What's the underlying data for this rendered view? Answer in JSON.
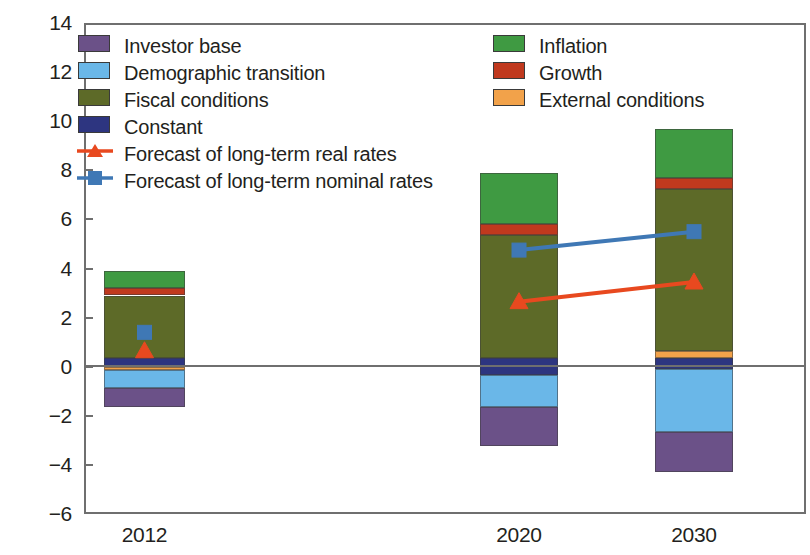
{
  "chart_data": {
    "type": "bar",
    "subtype": "stacked-bar-with-lines",
    "title": "",
    "subtitle": "",
    "xlabel": "",
    "ylabel": "",
    "categories": [
      "2012",
      "2020",
      "2030"
    ],
    "ylim": [
      -6,
      14
    ],
    "yticks": [
      -6,
      -4,
      -2,
      0,
      2,
      4,
      6,
      8,
      10,
      12,
      14
    ],
    "ytick_labels": [
      "−6",
      "−4",
      "−2",
      "0",
      "2",
      "4",
      "6",
      "8",
      "10",
      "12",
      "14"
    ],
    "grid": false,
    "legend_position": "inside-top",
    "series": [
      {
        "name": "Investor base",
        "color": "#6b5188",
        "values": [
          -0.8,
          -1.6,
          -1.65
        ]
      },
      {
        "name": "Demographic transition",
        "color": "#6ab7e8",
        "values": [
          -0.7,
          -1.3,
          -2.55
        ]
      },
      {
        "name": "Fiscal conditions",
        "color": "#5d6a28",
        "values": [
          2.55,
          5.0,
          6.6
        ]
      },
      {
        "name": "Constant",
        "color": "#2d3580",
        "values": [
          0.35,
          0.7,
          0.45
        ]
      },
      {
        "name": "Inflation",
        "color": "#3f9a42",
        "values": [
          0.7,
          2.1,
          2.0
        ]
      },
      {
        "name": "Growth",
        "color": "#c0391e",
        "values": [
          0.3,
          0.45,
          0.45
        ]
      },
      {
        "name": "External conditions",
        "color": "#f2a24a",
        "values": [
          0.15,
          0.0,
          0.3
        ]
      }
    ],
    "stack_segments": {
      "2012": [
        {
          "name": "Investor base",
          "from": -1.65,
          "to": -0.85
        },
        {
          "name": "Demographic transition",
          "from": -0.85,
          "to": -0.15
        },
        {
          "name": "External conditions",
          "from": -0.15,
          "to": 0.0
        },
        {
          "name": "Constant",
          "from": 0.0,
          "to": 0.35
        },
        {
          "name": "Fiscal conditions",
          "from": 0.35,
          "to": 2.9
        },
        {
          "name": "Growth",
          "from": 2.9,
          "to": 3.2
        },
        {
          "name": "Inflation",
          "from": 3.2,
          "to": 3.9
        }
      ],
      "2020": [
        {
          "name": "Investor base",
          "from": -3.25,
          "to": -1.65
        },
        {
          "name": "Demographic transition",
          "from": -1.65,
          "to": -0.35
        },
        {
          "name": "Constant",
          "from": -0.35,
          "to": 0.35
        },
        {
          "name": "Fiscal conditions",
          "from": 0.35,
          "to": 5.35
        },
        {
          "name": "Growth",
          "from": 5.35,
          "to": 5.8
        },
        {
          "name": "Inflation",
          "from": 5.8,
          "to": 7.9
        }
      ],
      "2030": [
        {
          "name": "Investor base",
          "from": -4.3,
          "to": -2.65
        },
        {
          "name": "Demographic transition",
          "from": -2.65,
          "to": -0.1
        },
        {
          "name": "Constant",
          "from": -0.1,
          "to": 0.35
        },
        {
          "name": "External conditions",
          "from": 0.35,
          "to": 0.65
        },
        {
          "name": "Fiscal conditions",
          "from": 0.65,
          "to": 7.25
        },
        {
          "name": "Growth",
          "from": 7.25,
          "to": 7.7
        },
        {
          "name": "Inflation",
          "from": 7.7,
          "to": 9.7
        }
      ]
    },
    "bar_totals_top": [
      3.9,
      7.9,
      9.7
    ],
    "bar_totals_bottom": [
      -1.65,
      -3.25,
      -4.3
    ],
    "lines": [
      {
        "name": "Forecast of long-term real rates",
        "color": "#e8491f",
        "marker": "triangle",
        "x": [
          "2012",
          "2020",
          "2030"
        ],
        "values": [
          0.65,
          2.65,
          3.45
        ],
        "segments_drawn": [
          [
            "2020",
            "2030"
          ]
        ]
      },
      {
        "name": "Forecast of long-term nominal rates",
        "color": "#3f78b5",
        "marker": "square",
        "x": [
          "2012",
          "2020",
          "2030"
        ],
        "values": [
          1.4,
          4.75,
          5.5
        ],
        "segments_drawn": [
          [
            "2020",
            "2030"
          ]
        ]
      }
    ]
  },
  "legend": {
    "left_column": [
      {
        "label": "Investor base",
        "color": "#6b5188",
        "marker": "swatch"
      },
      {
        "label": "Demographic transition",
        "color": "#6ab7e8",
        "marker": "swatch"
      },
      {
        "label": "Fiscal conditions",
        "color": "#5d6a28",
        "marker": "swatch"
      },
      {
        "label": "Constant",
        "color": "#2d3580",
        "marker": "swatch"
      },
      {
        "label": "Forecast of long-term real rates",
        "color": "#e8491f",
        "marker": "line-triangle"
      },
      {
        "label": "Forecast of long-term nominal rates",
        "color": "#3f78b5",
        "marker": "line-square"
      }
    ],
    "right_column": [
      {
        "label": "Inflation",
        "color": "#3f9a42",
        "marker": "swatch"
      },
      {
        "label": "Growth",
        "color": "#c0391e",
        "marker": "swatch"
      },
      {
        "label": "External conditions",
        "color": "#f2a24a",
        "marker": "swatch"
      }
    ]
  },
  "axis": {
    "y_labels": [
      "14",
      "12",
      "10",
      "8",
      "6",
      "4",
      "2",
      "0",
      "−2",
      "−4",
      "−6"
    ],
    "x_labels": [
      "2012",
      "2020",
      "2030"
    ]
  },
  "colors": {
    "investor_base": "#6b5188",
    "demographic_transition": "#6ab7e8",
    "fiscal_conditions": "#5d6a28",
    "constant": "#2d3580",
    "inflation": "#3f9a42",
    "growth": "#c0391e",
    "external_conditions": "#f2a24a",
    "real_rates_line": "#e8491f",
    "nominal_rates_line": "#3f78b5",
    "frame": "#6f6f6f",
    "text": "#231f20"
  }
}
